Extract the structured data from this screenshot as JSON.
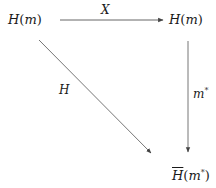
{
  "diagram": {
    "type": "commutative-diagram",
    "nodes": {
      "top_left": {
        "base": "H",
        "arg": "m"
      },
      "top_right": {
        "base": "H",
        "arg": "m"
      },
      "bottom_right": {
        "base": "H",
        "arg": "m",
        "arg_sup": "*",
        "overline": true
      }
    },
    "arrows": {
      "top": {
        "from": "top_left",
        "to": "top_right",
        "label": "X"
      },
      "right": {
        "from": "top_right",
        "to": "bottom_right",
        "label": "m",
        "label_sup": "*"
      },
      "diagonal": {
        "from": "top_left",
        "to": "bottom_right",
        "label": "H"
      }
    },
    "colors": {
      "stroke": "#555555",
      "text": "#1a1a1a"
    }
  }
}
